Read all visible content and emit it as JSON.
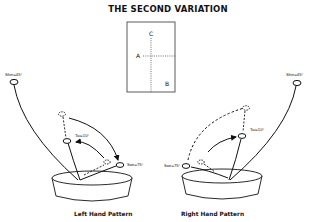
{
  "title": "THE SECOND VARIATION",
  "grid": {
    "labels": {
      "a": "A",
      "b": "B",
      "c": "C"
    }
  },
  "left": {
    "caption": "Left Hand Pattern",
    "shin": "Shin=45°",
    "tai": "Tai=10°",
    "soe": "Soe=75°"
  },
  "right": {
    "caption": "Right Hand Pattern",
    "shin": "Shin=45°",
    "tai": "Tai=10°",
    "soe": "Soe=75°"
  },
  "colors": {
    "ink": "#111111",
    "background": "#ffffff"
  }
}
